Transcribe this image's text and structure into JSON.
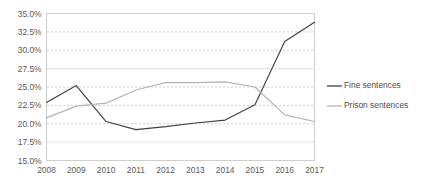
{
  "chart_data": {
    "type": "line",
    "title": "",
    "subtitle": "",
    "xlabel": "",
    "ylabel": "",
    "categories": [
      "2008",
      "2009",
      "2010",
      "2011",
      "2012",
      "2013",
      "2014",
      "2015",
      "2016",
      "2017"
    ],
    "x": [
      2008,
      2009,
      2010,
      2011,
      2012,
      2013,
      2014,
      2015,
      2016,
      2017
    ],
    "series": [
      {
        "name": "Fine sentences",
        "color": "#404040",
        "values": [
          22.9,
          25.2,
          20.3,
          19.2,
          19.6,
          20.1,
          20.5,
          22.6,
          31.2,
          33.8
        ]
      },
      {
        "name": "Prison sentences",
        "color": "#b3b3b3",
        "values": [
          20.8,
          22.4,
          22.8,
          24.6,
          25.6,
          25.6,
          25.7,
          25.0,
          21.2,
          20.3
        ]
      }
    ],
    "ylim": [
      15.0,
      35.0
    ],
    "ytick_values": [
      15.0,
      17.5,
      20.0,
      22.5,
      25.0,
      27.5,
      30.0,
      32.5,
      35.0
    ],
    "ytick_labels": [
      "15.0%",
      "17.5%",
      "20.0%",
      "22.5%",
      "25.0%",
      "27.5%",
      "30.0%",
      "32.5%",
      "35.0%"
    ],
    "ytick_suffix": "%",
    "grid": {
      "horizontal": true,
      "vertical": false,
      "color": "#b9b9b9",
      "style": "dashed"
    },
    "legend": {
      "position": "right",
      "entries": [
        {
          "label": "Fine sentences",
          "color": "#404040"
        },
        {
          "label": "Prison sentences",
          "color": "#b3b3b3"
        }
      ]
    },
    "plot_area": {
      "background": "#ffffff",
      "border_color": "#c9c9c9"
    },
    "figure_background": "#ffffff"
  }
}
